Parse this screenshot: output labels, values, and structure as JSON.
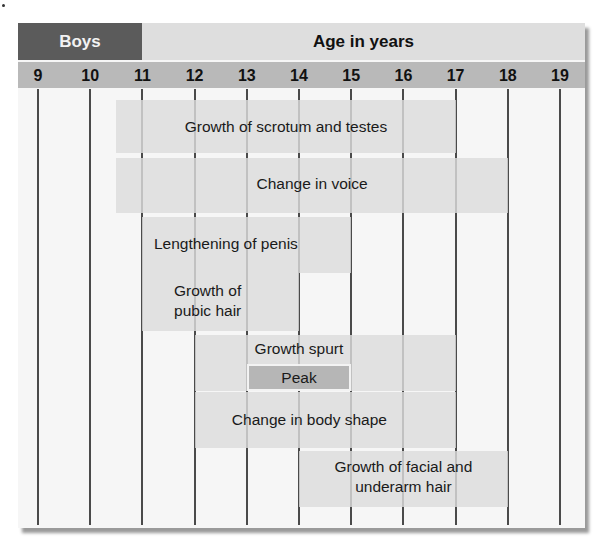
{
  "header": {
    "group_label": "Boys",
    "axis_title": "Age in years",
    "ticks": [
      "9",
      "10",
      "11",
      "12",
      "13",
      "14",
      "15",
      "16",
      "17",
      "18",
      "19"
    ]
  },
  "colors": {
    "group_header": "#5b5b5b",
    "title_band": "#dedede",
    "tick_band": "#b9b9b9",
    "bar": "#dcdcdc",
    "peak_bar": "#b4b4b4",
    "gridline": "#4a4a4a"
  },
  "chart_data": {
    "type": "gantt",
    "title": "Boys",
    "xlabel": "Age in years",
    "xlim": [
      9,
      19
    ],
    "x_ticks": [
      9,
      10,
      11,
      12,
      13,
      14,
      15,
      16,
      17,
      18,
      19
    ],
    "grid": true,
    "events": [
      {
        "label": "Growth of scrotum and testes",
        "start": 10.5,
        "end": 17
      },
      {
        "label": "Change in voice",
        "start": 10.5,
        "end": 18
      },
      {
        "label": "Lengthening of penis",
        "start": 11,
        "end": 15
      },
      {
        "label": "Growth of\npubic hair",
        "start": 11,
        "end": 14
      },
      {
        "label": "Growth spurt",
        "start": 12,
        "end": 17
      },
      {
        "label": "Peak",
        "start": 13,
        "end": 15,
        "sub_of": "Growth spurt"
      },
      {
        "label": "Change in body shape",
        "start": 12,
        "end": 17
      },
      {
        "label": "Growth of facial and\nunderarm hair",
        "start": 14,
        "end": 18
      }
    ]
  }
}
